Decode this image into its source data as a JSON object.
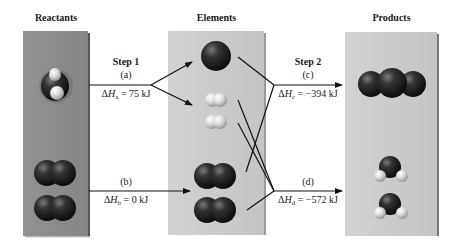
{
  "headers": {
    "reactants": "Reactants",
    "elements": "Elements",
    "products": "Products"
  },
  "steps": {
    "step1": "Step 1",
    "step2": "Step 2"
  },
  "reactions": [
    {
      "id": "a",
      "label": "(a)",
      "delta": "ΔH",
      "sub": "a",
      "value": " = 75 kJ"
    },
    {
      "id": "b",
      "label": "(b)",
      "delta": "ΔH",
      "sub": "b",
      "value": " = 0 kJ"
    },
    {
      "id": "c",
      "label": "(c)",
      "delta": "ΔH",
      "sub": "c",
      "value": " = −394 kJ"
    },
    {
      "id": "d",
      "label": "(d)",
      "delta": "ΔH",
      "sub": "d",
      "value": " = −572 kJ"
    }
  ],
  "colors": {
    "reactants_panel": "#8c8c8c",
    "elements_panel": "#cbcbcb",
    "products_panel": "#cccccc",
    "carbon_atom": "#1c1c1c",
    "oxygen_atom": "#2a2a2a",
    "hydrogen_atom": "#d8d8d8",
    "line": "#111111"
  },
  "molecules": {
    "reactants": [
      "CH4",
      "O2",
      "O2"
    ],
    "elements": [
      "C",
      "H2",
      "H2",
      "O2",
      "O2"
    ],
    "products": [
      "CO2",
      "H2O",
      "H2O"
    ]
  }
}
